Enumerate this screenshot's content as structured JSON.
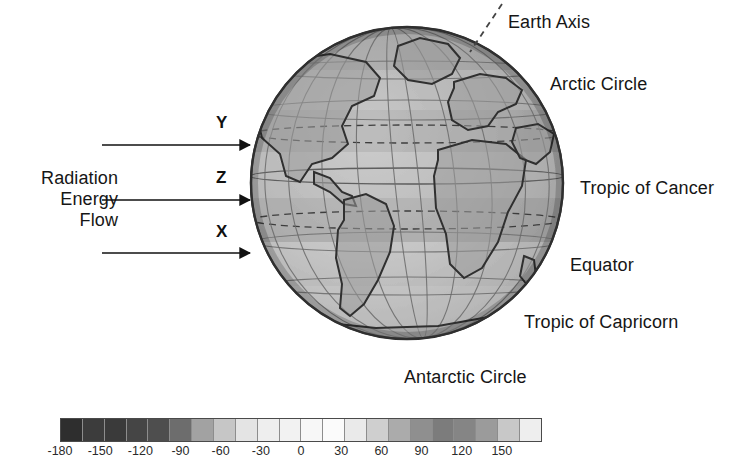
{
  "figure": {
    "type": "diagram",
    "background_color": "#ffffff"
  },
  "left_annotation": {
    "radiation_label": "Radiation\nEnergy\nFlow"
  },
  "rays": [
    {
      "id": "Y",
      "label": "Y",
      "y": 145,
      "description": "upper ray striking mid-northern latitudes"
    },
    {
      "id": "Z",
      "label": "Z",
      "y": 200,
      "description": "middle ray striking near Tropic of Cancer"
    },
    {
      "id": "X",
      "label": "X",
      "y": 253,
      "description": "lower ray striking near Equator"
    }
  ],
  "globe_labels": [
    {
      "name": "earth-axis",
      "text": "Earth Axis"
    },
    {
      "name": "arctic-circle",
      "text": "Arctic Circle"
    },
    {
      "name": "tropic-of-cancer",
      "text": "Tropic of Cancer"
    },
    {
      "name": "equator",
      "text": "Equator"
    },
    {
      "name": "tropic-of-capricorn",
      "text": "Tropic of Capricorn"
    },
    {
      "name": "antarctic-circle",
      "text": "Antarctic Circle"
    }
  ],
  "chart_data": {
    "type": "heatmap",
    "title": "",
    "xlabel": "",
    "ylabel": "",
    "orientation": "horizontal",
    "legend_position": "bottom",
    "grid": false,
    "colorbar": {
      "tick_labels": [
        "-180",
        "-150",
        "-120",
        "-90",
        "-60",
        "-30",
        "0",
        "30",
        "60",
        "90",
        "120",
        "150"
      ],
      "tick_values": [
        -180,
        -150,
        -120,
        -90,
        -60,
        -30,
        0,
        30,
        60,
        90,
        120,
        150
      ],
      "range": [
        -180,
        180
      ],
      "step": 30,
      "cell_count": 22,
      "cell_colors": [
        "#2e2e2e",
        "#3c3c3c",
        "#3a3a3a",
        "#454545",
        "#4e4e4e",
        "#6d6d6d",
        "#a2a2a2",
        "#c6c6c6",
        "#e4e4e4",
        "#eeeeee",
        "#f2f2f2",
        "#f7f7f7",
        "#fbfbfb",
        "#eaeaea",
        "#cfcfcf",
        "#ababab",
        "#8f8f8f",
        "#7c7c7c",
        "#858585",
        "#9b9b9b",
        "#c8c8c8",
        "#eeeeee"
      ]
    }
  },
  "globe": {
    "projection": "orthographic",
    "center_longitude": -30,
    "graticule_spacing_deg": 30,
    "dashed_circles": [
      "Tropic of Cancer",
      "Tropic of Capricorn"
    ],
    "ocean_shade": "#b8b8b8",
    "land_outline": "#3a3a3a"
  }
}
